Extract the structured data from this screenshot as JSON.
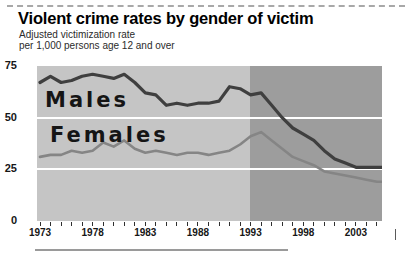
{
  "header": {
    "title": "Violent crime rates by gender of victim",
    "subtitle_line1": "Adjusted victimization rate",
    "subtitle_line2": "per 1,000 persons age 12 and over"
  },
  "chart_data": {
    "type": "line",
    "title": "Violent crime rates by gender of victim",
    "ylabel": "Adjusted victimization rate per 1,000 persons age 12 and over",
    "ylim": [
      0,
      75
    ],
    "yticks": [
      75,
      50,
      25,
      0
    ],
    "grid": "horizontal white lines at 25 and 50",
    "legend_position": "inline labels on plot",
    "x": [
      1973,
      1974,
      1975,
      1976,
      1977,
      1978,
      1979,
      1980,
      1981,
      1982,
      1983,
      1984,
      1985,
      1986,
      1987,
      1988,
      1989,
      1990,
      1991,
      1992,
      1993,
      1994,
      1995,
      1996,
      1997,
      1998,
      1999,
      2000,
      2001,
      2002,
      2003,
      2004,
      2005
    ],
    "xticks_labeled": [
      "1973",
      "1978",
      "1983",
      "1988",
      "1993",
      "1998",
      "2003"
    ],
    "series": [
      {
        "name": "Males",
        "color": "#3f3f3f",
        "values": [
          67,
          70,
          67,
          68,
          70,
          71,
          70,
          69,
          71,
          67,
          62,
          61,
          56,
          57,
          56,
          57,
          57,
          58,
          65,
          64,
          61,
          62,
          56,
          50,
          45,
          42,
          39,
          34,
          30,
          28,
          26,
          26,
          26
        ]
      },
      {
        "name": "Females",
        "color": "#858585",
        "values": [
          31,
          32,
          32,
          34,
          33,
          34,
          38,
          36,
          39,
          35,
          33,
          34,
          33,
          32,
          33,
          33,
          32,
          33,
          34,
          37,
          41,
          43,
          39,
          35,
          31,
          29,
          27,
          24,
          23,
          22,
          21,
          20,
          19
        ]
      }
    ],
    "background": {
      "light_era": "1973-1993",
      "light_color": "#c5c5c5",
      "dark_era": "1993-2005",
      "dark_color": "#9d9d9d"
    }
  }
}
